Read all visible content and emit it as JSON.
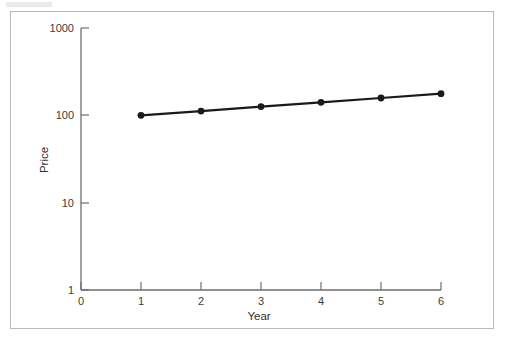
{
  "figure": {
    "background_color": "#ffffff",
    "border_color": "#b9b9b9",
    "line_color": "#1a1a1a",
    "axis_color": "#6e6e6e",
    "text_color": "#3b3b3b"
  },
  "chart_data": {
    "type": "line",
    "title": "",
    "xlabel": "Year",
    "ylabel": "Price",
    "yscale": "log",
    "xlim": [
      0,
      6
    ],
    "ylim": [
      1,
      1000
    ],
    "grid": false,
    "legend": null,
    "x": [
      1,
      2,
      3,
      4,
      5,
      6
    ],
    "values": [
      100,
      112,
      126,
      141,
      158,
      177
    ],
    "series": [
      {
        "name": "Price",
        "marker": "filled-circle",
        "values": [
          100,
          112,
          126,
          141,
          158,
          177
        ]
      }
    ],
    "xticks": [
      0,
      1,
      2,
      3,
      4,
      5,
      6
    ],
    "xtick_labels": [
      "0",
      "1",
      "2",
      "3",
      "4",
      "5",
      "6"
    ],
    "yticks": [
      1,
      10,
      100,
      1000
    ],
    "ytick_labels": [
      "1",
      "10",
      "100",
      "1000"
    ]
  },
  "labels": {
    "y_1000": "1000",
    "y_100": "100",
    "y_10": "10",
    "y_1": "1",
    "x_0": "0",
    "x_1": "1",
    "x_2": "2",
    "x_3": "3",
    "x_4": "4",
    "x_5": "5",
    "x_6": "6",
    "y_axis_title": "Price",
    "x_axis_title": "Year"
  }
}
